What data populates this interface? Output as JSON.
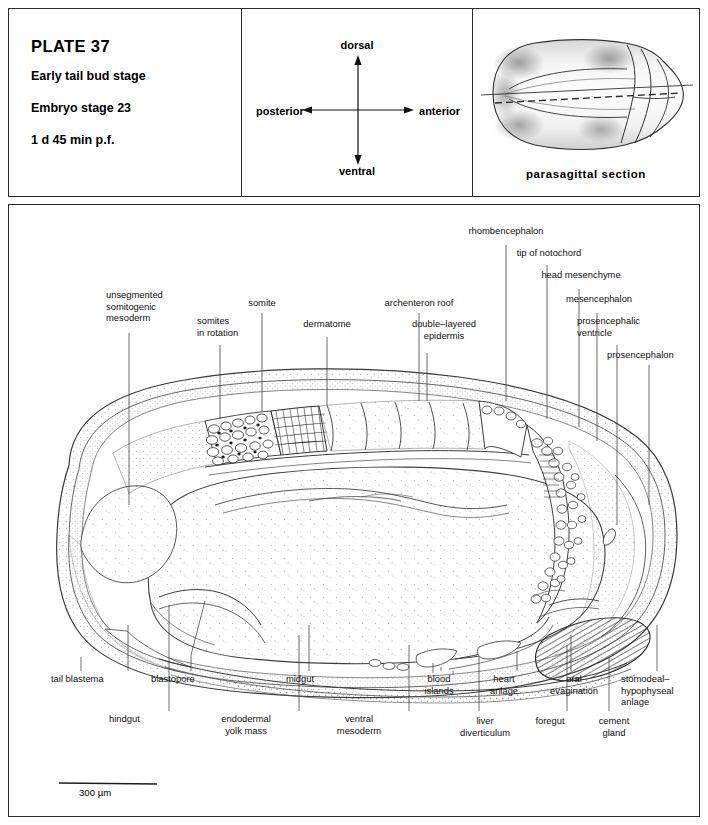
{
  "header": {
    "title": {
      "plate": "PLATE 37",
      "stage_name": "Early tail bud stage",
      "embryo_stage": "Embryo stage 23",
      "time": "1 d  45 min  p.f."
    },
    "axes": {
      "dorsal": "dorsal",
      "ventral": "ventral",
      "posterior": "posterior",
      "anterior": "anterior"
    },
    "thumbnail": {
      "caption": "parasagittal section"
    }
  },
  "figure": {
    "scale_bar": {
      "label": "300 µm"
    },
    "top_labels": [
      {
        "id": "unsegmented-somitogenic-mesoderm",
        "text": "unsegmented\nsomitogenic\nmesoderm"
      },
      {
        "id": "somites-in-rotation",
        "text": "somites\nin rotation"
      },
      {
        "id": "somite",
        "text": "somite"
      },
      {
        "id": "dermatome",
        "text": "dermatome"
      },
      {
        "id": "archenteron-roof",
        "text": "archenteron roof"
      },
      {
        "id": "double-layered-epidermis",
        "text": "double–layered\nepidermis"
      },
      {
        "id": "rhombencephalon",
        "text": "rhombencephalon"
      },
      {
        "id": "tip-of-notochord",
        "text": "tip of notochord"
      },
      {
        "id": "head-mesenchyme",
        "text": "head mesenchyme"
      },
      {
        "id": "mesencephalon",
        "text": "mesencephalon"
      },
      {
        "id": "prosencephalic-ventricle",
        "text": "prosencephalic\nventricle"
      },
      {
        "id": "prosencephalon",
        "text": "prosencephalon"
      }
    ],
    "bottom_labels": [
      {
        "id": "tail-blastema",
        "text": "tail blastema"
      },
      {
        "id": "hindgut",
        "text": "hindgut"
      },
      {
        "id": "blastopore",
        "text": "blastopore"
      },
      {
        "id": "endodermal-yolk-mass",
        "text": "endodermal\nyolk mass"
      },
      {
        "id": "midgut",
        "text": "midgut"
      },
      {
        "id": "ventral-mesoderm",
        "text": "ventral\nmesoderm"
      },
      {
        "id": "blood-islands",
        "text": "blood\nislands"
      },
      {
        "id": "liver-diverticulum",
        "text": "liver\ndiverticulum"
      },
      {
        "id": "heart-anlage",
        "text": "heart\nanlage"
      },
      {
        "id": "foregut",
        "text": "foregut"
      },
      {
        "id": "oral-evagination",
        "text": "oral\nevagination"
      },
      {
        "id": "cement-gland",
        "text": "cement\ngland"
      },
      {
        "id": "stomodeal-hypophyseal-anlage",
        "text": "stomodeal–\nhypophyseal\nanlage"
      }
    ]
  },
  "colors": {
    "ink": "#2b2b2b",
    "line": "#444444",
    "stipple": "#6a6a6a",
    "background": "#ffffff"
  }
}
